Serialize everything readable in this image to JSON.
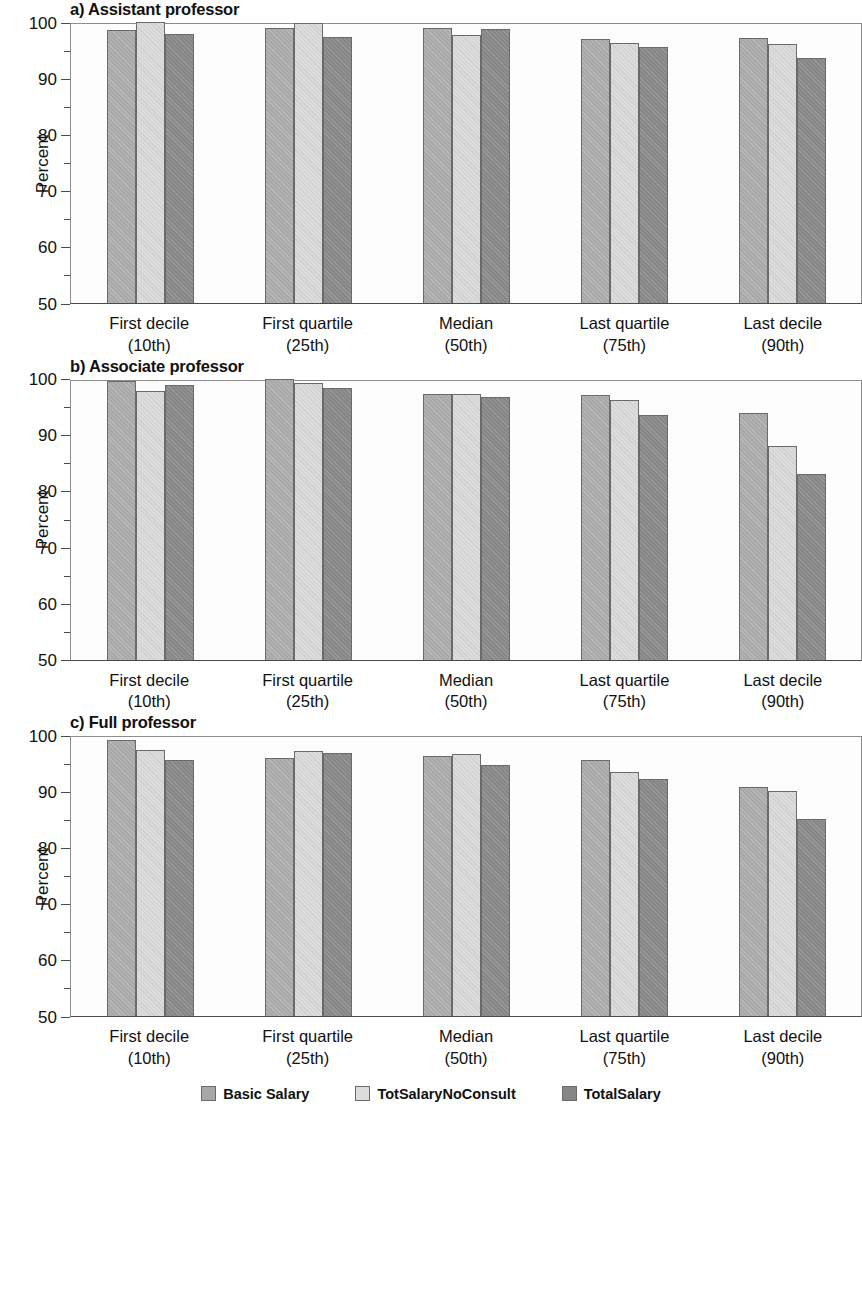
{
  "figure": {
    "ylabel": "Percent",
    "series": [
      {
        "name": "Basic Salary",
        "color": "#a8a8a8"
      },
      {
        "name": "TotSalaryNoConsult",
        "color": "#dcdcdc"
      },
      {
        "name": "TotalSalary",
        "color": "#868686"
      }
    ],
    "categories": [
      {
        "line1": "First decile",
        "line2": "(10th)"
      },
      {
        "line1": "First quartile",
        "line2": "(25th)"
      },
      {
        "line1": "Median",
        "line2": "(50th)"
      },
      {
        "line1": "Last quartile",
        "line2": "(75th)"
      },
      {
        "line1": "Last decile",
        "line2": "(90th)"
      }
    ],
    "y_ticks_major": [
      "100",
      "90",
      "80",
      "70",
      "60",
      "50"
    ],
    "panels": [
      {
        "title": "a) Assistant professor"
      },
      {
        "title": "b) Associate professor"
      },
      {
        "title": "c) Full professor"
      }
    ]
  },
  "chart_data": [
    {
      "type": "bar",
      "title": "a) Assistant professor",
      "xlabel": "",
      "ylabel": "Percent",
      "ylim": [
        50,
        100
      ],
      "yticks": [
        50,
        60,
        70,
        80,
        90,
        100
      ],
      "minor_yticks": [
        55,
        65,
        75,
        85,
        95
      ],
      "grid": false,
      "legend_position": "bottom",
      "categories": [
        "First decile (10th)",
        "First quartile (25th)",
        "Median (50th)",
        "Last quartile (75th)",
        "Last decile (90th)"
      ],
      "series": [
        {
          "name": "Basic Salary",
          "values": [
            98.5,
            98.9,
            98.9,
            97.0,
            97.2
          ]
        },
        {
          "name": "TotSalaryNoConsult",
          "values": [
            100.4,
            99.9,
            97.7,
            96.2,
            96.0
          ]
        },
        {
          "name": "TotalSalary",
          "values": [
            97.9,
            97.4,
            98.8,
            95.6,
            93.6
          ]
        }
      ]
    },
    {
      "type": "bar",
      "title": "b) Associate professor",
      "xlabel": "",
      "ylabel": "Percent",
      "ylim": [
        50,
        100
      ],
      "yticks": [
        50,
        60,
        70,
        80,
        90,
        100
      ],
      "minor_yticks": [
        55,
        65,
        75,
        85,
        95
      ],
      "grid": false,
      "legend_position": "bottom",
      "categories": [
        "First decile (10th)",
        "First quartile (25th)",
        "Median (50th)",
        "Last quartile (75th)",
        "Last decile (90th)"
      ],
      "series": [
        {
          "name": "Basic Salary",
          "values": [
            99.6,
            100.7,
            97.2,
            97.0,
            93.8
          ]
        },
        {
          "name": "TotSalaryNoConsult",
          "values": [
            97.7,
            99.2,
            97.3,
            96.2,
            88.0
          ]
        },
        {
          "name": "TotalSalary",
          "values": [
            98.9,
            98.4,
            96.8,
            93.5,
            83.0
          ]
        }
      ]
    },
    {
      "type": "bar",
      "title": "c) Full professor",
      "xlabel": "",
      "ylabel": "Percent",
      "ylim": [
        50,
        100
      ],
      "yticks": [
        50,
        60,
        70,
        80,
        90,
        100
      ],
      "minor_yticks": [
        55,
        65,
        75,
        85,
        95
      ],
      "grid": false,
      "legend_position": "bottom",
      "categories": [
        "First decile (10th)",
        "First quartile (25th)",
        "Median (50th)",
        "Last quartile (75th)",
        "Last decile (90th)"
      ],
      "series": [
        {
          "name": "Basic Salary",
          "values": [
            99.2,
            96.0,
            96.2,
            95.6,
            90.8
          ]
        },
        {
          "name": "TotSalaryNoConsult",
          "values": [
            97.4,
            97.2,
            96.6,
            93.5,
            90.0
          ]
        },
        {
          "name": "TotalSalary",
          "values": [
            95.5,
            96.9,
            94.6,
            92.1,
            85.0
          ]
        }
      ]
    }
  ]
}
